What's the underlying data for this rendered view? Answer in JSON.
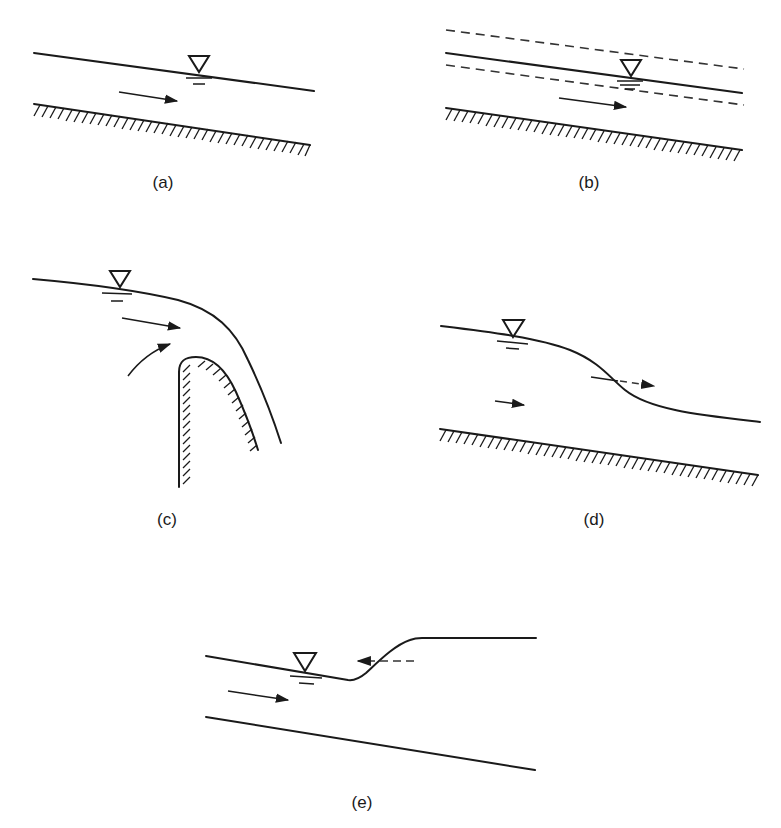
{
  "figure": {
    "panels": [
      {
        "id": "a",
        "label": "(a)",
        "description": "Uniform flow: water surface parallel to sloping channel bed, flow arrow pointing downstream"
      },
      {
        "id": "b",
        "label": "(b)",
        "description": "Uniform flow with dashed lines above and below the water surface"
      },
      {
        "id": "c",
        "label": "(c)",
        "description": "Flow over a rounded weir/spillway crest, water surface curving down over the crest"
      },
      {
        "id": "d",
        "label": "(d)",
        "description": "Gradually falling water surface (drawdown) with a dashed arrow at the inflection point"
      },
      {
        "id": "e",
        "label": "(e)",
        "description": "Hydraulic jump / surge: water surface rising abruptly, dashed arrow pointing upstream"
      }
    ],
    "symbols": {
      "free_surface": "inverted-triangle-icon",
      "flow_direction": "arrow-right-icon",
      "bed": "hatched-boundary"
    },
    "colors": {
      "ink": "#1a1a1a",
      "background": "#ffffff"
    }
  }
}
